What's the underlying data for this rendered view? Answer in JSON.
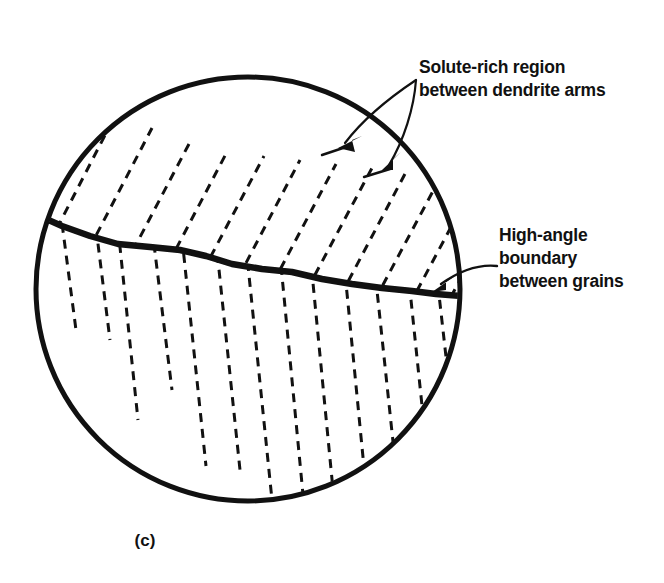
{
  "figure": {
    "caption": "(c)",
    "ink_color": "#111111",
    "background_color": "#ffffff"
  },
  "annotations": {
    "solute_rich": {
      "line1": "Solute-rich region",
      "line2": "between dendrite arms"
    },
    "high_angle": {
      "line1": "High-angle",
      "line2": "boundary",
      "line3": "between grains"
    }
  },
  "diagram": {
    "type": "schematic",
    "grain_outline": {
      "shape": "circle",
      "center_x": 248,
      "center_y": 289,
      "radius": 214,
      "stroke_width": 5
    },
    "grain_boundary": {
      "description": "thick wavy high-angle boundary crossing the circle from left edge to right edge",
      "stroke_width": 6,
      "points": [
        [
          35,
          214
        ],
        [
          62,
          226
        ],
        [
          90,
          236
        ],
        [
          118,
          244
        ],
        [
          150,
          247
        ],
        [
          180,
          250
        ],
        [
          206,
          256
        ],
        [
          232,
          264
        ],
        [
          262,
          269
        ],
        [
          292,
          272
        ],
        [
          322,
          279
        ],
        [
          352,
          284
        ],
        [
          382,
          288
        ],
        [
          412,
          291
        ],
        [
          436,
          294
        ],
        [
          462,
          296
        ]
      ]
    },
    "upper_grain": {
      "label": "upper grain",
      "dendrite_line_angle_deg": 61,
      "dendrite_line_count": 12,
      "dash_pattern": "9 7",
      "stroke_width": 3
    },
    "lower_grain": {
      "label": "lower grain",
      "dendrite_line_angle_deg": 84,
      "dendrite_line_count": 13,
      "dash_pattern": "9 7",
      "stroke_width": 3
    },
    "leaders": {
      "solute_rich": {
        "origin": [
          416,
          80
        ],
        "arrow_tips": [
          [
            340,
            146
          ],
          [
            384,
            168
          ]
        ],
        "count": 2
      },
      "high_angle": {
        "origin": [
          496,
          264
        ],
        "arrow_tips": [
          [
            434,
            288
          ]
        ],
        "count": 1
      }
    }
  }
}
